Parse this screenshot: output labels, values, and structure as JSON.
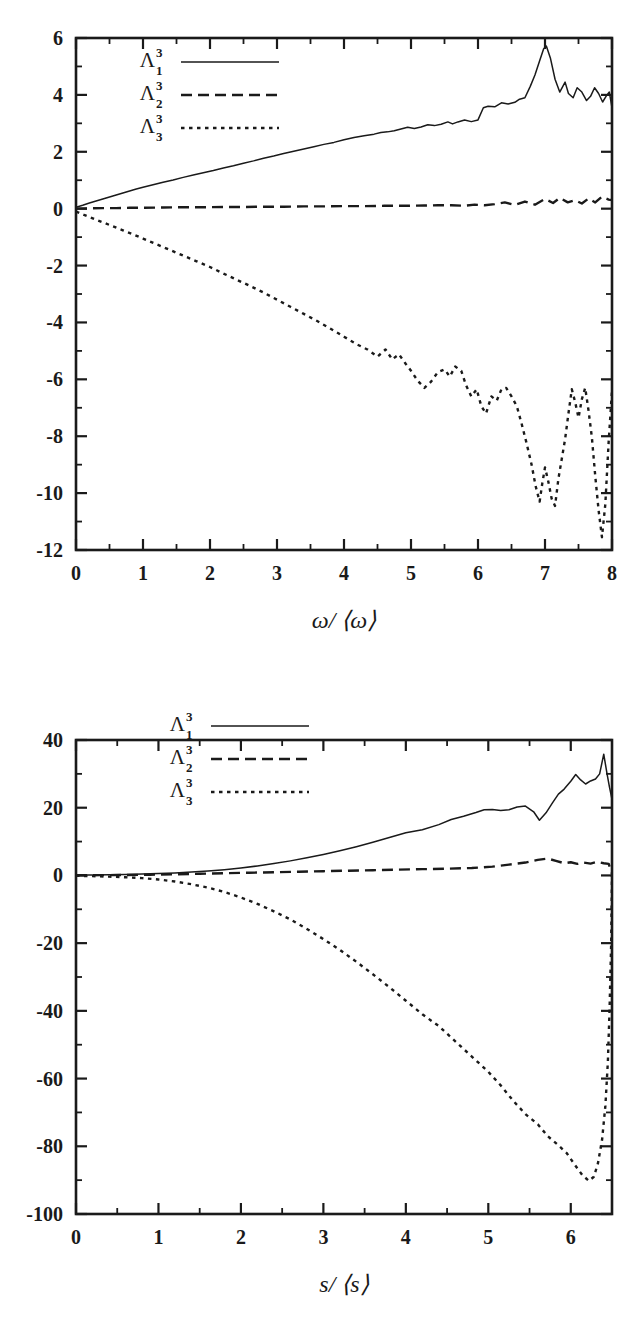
{
  "figure": {
    "background": "#ffffff",
    "ink": "#1a1a1a"
  },
  "chart_data": [
    {
      "id": "top",
      "type": "line",
      "title": "",
      "xlabel": "ω/ ⟨ω⟩",
      "ylabel": "",
      "xlim": [
        0,
        8
      ],
      "ylim": [
        -12,
        6
      ],
      "xticks": [
        0,
        1,
        2,
        3,
        4,
        5,
        6,
        7,
        8
      ],
      "xticklabels": [
        "0",
        "1",
        "2",
        "3",
        "4",
        "5",
        "6",
        "7",
        "8"
      ],
      "yticks": [
        6,
        4,
        2,
        0,
        -2,
        -4,
        -6,
        -8,
        -10,
        -12
      ],
      "yticklabels": [
        "6",
        "4",
        "2",
        "0",
        "-2",
        "-4",
        "-6",
        "-8",
        "-10",
        "-12"
      ],
      "grid": false,
      "legend_position": "upper-left",
      "legend": [
        "Λ₁³",
        "Λ₂³",
        "Λ₃³"
      ],
      "series": [
        {
          "name": "Λ₁³",
          "style": "solid",
          "x": [
            0.0,
            0.1,
            0.2,
            0.3,
            0.4,
            0.5,
            0.6,
            0.7,
            0.8,
            0.9,
            1.0,
            1.15,
            1.3,
            1.45,
            1.6,
            1.75,
            1.9,
            2.05,
            2.2,
            2.35,
            2.5,
            2.65,
            2.8,
            2.95,
            3.1,
            3.25,
            3.4,
            3.55,
            3.7,
            3.85,
            4.0,
            4.15,
            4.3,
            4.45,
            4.55,
            4.65,
            4.75,
            4.85,
            4.95,
            5.05,
            5.15,
            5.25,
            5.35,
            5.45,
            5.55,
            5.62,
            5.7,
            5.8,
            5.9,
            6.0,
            6.08,
            6.15,
            6.25,
            6.35,
            6.45,
            6.55,
            6.62,
            6.7,
            6.78,
            6.85,
            6.92,
            6.98,
            7.02,
            7.08,
            7.15,
            7.22,
            7.3,
            7.35,
            7.42,
            7.48,
            7.55,
            7.62,
            7.68,
            7.74,
            7.8,
            7.86,
            7.92,
            7.96,
            8.0
          ],
          "y": [
            0.05,
            0.12,
            0.2,
            0.27,
            0.34,
            0.41,
            0.48,
            0.55,
            0.62,
            0.69,
            0.75,
            0.84,
            0.93,
            1.01,
            1.1,
            1.18,
            1.26,
            1.34,
            1.43,
            1.51,
            1.6,
            1.68,
            1.77,
            1.85,
            1.94,
            2.02,
            2.1,
            2.18,
            2.26,
            2.33,
            2.42,
            2.5,
            2.56,
            2.62,
            2.68,
            2.7,
            2.74,
            2.8,
            2.86,
            2.82,
            2.87,
            2.95,
            2.92,
            2.97,
            3.05,
            2.98,
            3.05,
            3.12,
            3.06,
            3.12,
            3.55,
            3.6,
            3.58,
            3.72,
            3.68,
            3.74,
            3.85,
            3.9,
            4.3,
            4.7,
            5.2,
            5.62,
            5.72,
            5.3,
            4.55,
            4.1,
            4.45,
            4.05,
            3.9,
            4.25,
            4.1,
            3.8,
            3.95,
            4.25,
            4.05,
            3.75,
            3.98,
            4.1,
            3.55
          ]
        },
        {
          "name": "Λ₂³",
          "style": "dashed",
          "x": [
            0.0,
            0.2,
            0.4,
            0.6,
            0.8,
            1.0,
            1.3,
            1.6,
            1.9,
            2.2,
            2.5,
            2.8,
            3.1,
            3.4,
            3.7,
            4.0,
            4.3,
            4.6,
            4.9,
            5.2,
            5.4,
            5.6,
            5.8,
            5.95,
            6.1,
            6.25,
            6.4,
            6.55,
            6.7,
            6.85,
            7.0,
            7.12,
            7.22,
            7.34,
            7.45,
            7.55,
            7.65,
            7.75,
            7.85,
            7.95,
            8.0
          ],
          "y": [
            0.0,
            0.01,
            0.02,
            0.02,
            0.03,
            0.03,
            0.04,
            0.05,
            0.05,
            0.06,
            0.06,
            0.07,
            0.07,
            0.08,
            0.08,
            0.09,
            0.09,
            0.1,
            0.1,
            0.11,
            0.12,
            0.12,
            0.1,
            0.14,
            0.12,
            0.16,
            0.22,
            0.13,
            0.25,
            0.14,
            0.34,
            0.2,
            0.38,
            0.22,
            0.3,
            0.18,
            0.36,
            0.22,
            0.42,
            0.32,
            0.3
          ]
        },
        {
          "name": "Λ₃³",
          "style": "dotted",
          "x": [
            0.0,
            0.12,
            0.25,
            0.4,
            0.55,
            0.7,
            0.85,
            1.0,
            1.2,
            1.4,
            1.6,
            1.8,
            2.0,
            2.2,
            2.4,
            2.6,
            2.8,
            3.0,
            3.2,
            3.4,
            3.6,
            3.8,
            4.0,
            4.2,
            4.35,
            4.5,
            4.62,
            4.72,
            4.82,
            4.92,
            5.0,
            5.1,
            5.2,
            5.3,
            5.4,
            5.5,
            5.58,
            5.66,
            5.75,
            5.82,
            5.9,
            5.98,
            6.05,
            6.12,
            6.2,
            6.28,
            6.35,
            6.42,
            6.5,
            6.58,
            6.65,
            6.72,
            6.8,
            6.86,
            6.92,
            6.96,
            7.0,
            7.05,
            7.1,
            7.15,
            7.2,
            7.25,
            7.3,
            7.35,
            7.4,
            7.45,
            7.5,
            7.55,
            7.6,
            7.65,
            7.7,
            7.75,
            7.8,
            7.85,
            7.9,
            7.95,
            8.0
          ],
          "y": [
            -0.1,
            -0.22,
            -0.34,
            -0.48,
            -0.62,
            -0.76,
            -0.9,
            -1.05,
            -1.25,
            -1.45,
            -1.65,
            -1.85,
            -2.05,
            -2.28,
            -2.5,
            -2.72,
            -2.95,
            -3.2,
            -3.45,
            -3.7,
            -3.95,
            -4.22,
            -4.5,
            -4.78,
            -4.95,
            -5.2,
            -4.95,
            -5.3,
            -5.12,
            -5.45,
            -5.7,
            -6.05,
            -6.3,
            -6.08,
            -5.75,
            -5.65,
            -5.9,
            -5.55,
            -5.7,
            -6.2,
            -6.6,
            -6.35,
            -6.95,
            -7.2,
            -6.6,
            -6.75,
            -6.35,
            -6.3,
            -6.6,
            -6.95,
            -7.55,
            -8.2,
            -9.0,
            -9.75,
            -10.3,
            -9.65,
            -9.1,
            -9.6,
            -10.2,
            -10.45,
            -9.5,
            -8.8,
            -8.1,
            -7.2,
            -6.35,
            -6.8,
            -7.35,
            -6.7,
            -6.3,
            -7.1,
            -8.05,
            -9.4,
            -10.6,
            -11.55,
            -10.4,
            -8.2,
            -6.4
          ]
        }
      ]
    },
    {
      "id": "bottom",
      "type": "line",
      "title": "",
      "xlabel": "s/ ⟨s⟩",
      "ylabel": "",
      "xlim": [
        0,
        6.5
      ],
      "ylim": [
        -100,
        40
      ],
      "xticks": [
        0,
        1,
        2,
        3,
        4,
        5,
        6
      ],
      "xticklabels": [
        "0",
        "1",
        "2",
        "3",
        "4",
        "5",
        "6"
      ],
      "yticks": [
        40,
        20,
        0,
        -20,
        -40,
        -60,
        -80,
        -100
      ],
      "yticklabels": [
        "40",
        "20",
        "0",
        "-20",
        "-40",
        "-60",
        "-80",
        "-100"
      ],
      "grid": false,
      "legend_position": "upper-left",
      "legend": [
        "Λ₁³",
        "Λ₂³",
        "Λ₃³"
      ],
      "series": [
        {
          "name": "Λ₁³",
          "style": "solid",
          "x": [
            0.0,
            0.2,
            0.4,
            0.6,
            0.8,
            1.0,
            1.2,
            1.4,
            1.6,
            1.8,
            2.0,
            2.2,
            2.4,
            2.6,
            2.8,
            3.0,
            3.2,
            3.4,
            3.6,
            3.8,
            4.0,
            4.2,
            4.4,
            4.55,
            4.7,
            4.85,
            4.95,
            5.05,
            5.15,
            5.25,
            5.35,
            5.45,
            5.55,
            5.62,
            5.7,
            5.78,
            5.85,
            5.92,
            6.0,
            6.06,
            6.12,
            6.18,
            6.24,
            6.3,
            6.35,
            6.4,
            6.44,
            6.47,
            6.5
          ],
          "y": [
            0.1,
            0.15,
            0.22,
            0.3,
            0.4,
            0.55,
            0.75,
            1.0,
            1.3,
            1.7,
            2.2,
            2.8,
            3.5,
            4.3,
            5.2,
            6.2,
            7.3,
            8.5,
            9.8,
            11.2,
            12.6,
            13.5,
            15.0,
            16.5,
            17.5,
            18.6,
            19.4,
            19.5,
            19.2,
            19.4,
            20.2,
            20.5,
            18.8,
            16.3,
            18.5,
            21.5,
            24.0,
            25.5,
            27.8,
            29.8,
            28.2,
            27.0,
            27.9,
            28.5,
            30.0,
            35.8,
            30.0,
            26.0,
            22.5
          ]
        },
        {
          "name": "Λ₂³",
          "style": "dashed",
          "x": [
            0.0,
            0.3,
            0.6,
            0.9,
            1.2,
            1.5,
            1.8,
            2.1,
            2.4,
            2.7,
            3.0,
            3.3,
            3.6,
            3.9,
            4.2,
            4.5,
            4.8,
            5.05,
            5.25,
            5.45,
            5.6,
            5.72,
            5.82,
            5.92,
            6.0,
            6.08,
            6.16,
            6.24,
            6.32,
            6.4,
            6.46,
            6.5
          ],
          "y": [
            0.05,
            0.08,
            0.12,
            0.2,
            0.35,
            0.5,
            0.65,
            0.8,
            0.95,
            1.1,
            1.25,
            1.4,
            1.55,
            1.7,
            1.85,
            2.0,
            2.2,
            2.6,
            3.2,
            3.8,
            4.6,
            5.0,
            4.3,
            3.6,
            3.9,
            3.4,
            3.8,
            3.5,
            4.0,
            3.6,
            3.4,
            0.5
          ]
        },
        {
          "name": "Λ₃³",
          "style": "dotted",
          "x": [
            0.0,
            0.2,
            0.4,
            0.6,
            0.8,
            1.0,
            1.2,
            1.4,
            1.6,
            1.8,
            2.0,
            2.2,
            2.4,
            2.6,
            2.8,
            3.0,
            3.2,
            3.4,
            3.6,
            3.8,
            4.0,
            4.2,
            4.4,
            4.6,
            4.8,
            5.0,
            5.15,
            5.3,
            5.45,
            5.6,
            5.72,
            5.84,
            5.95,
            6.05,
            6.14,
            6.22,
            6.28,
            6.33,
            6.38,
            6.42,
            6.45,
            6.47,
            6.49,
            6.5
          ],
          "y": [
            -0.1,
            -0.2,
            -0.35,
            -0.55,
            -0.8,
            -1.2,
            -1.8,
            -2.6,
            -3.6,
            -4.9,
            -6.5,
            -8.4,
            -10.6,
            -13.0,
            -15.8,
            -18.8,
            -22.0,
            -25.5,
            -29.2,
            -33.0,
            -37.0,
            -41.0,
            -44.5,
            -49.0,
            -53.5,
            -58.0,
            -62.0,
            -66.5,
            -70.5,
            -73.5,
            -77.0,
            -79.5,
            -82.0,
            -85.5,
            -88.5,
            -90.2,
            -89.0,
            -85.0,
            -78.0,
            -68.0,
            -55.0,
            -40.0,
            -20.0,
            0.0
          ]
        }
      ]
    }
  ]
}
